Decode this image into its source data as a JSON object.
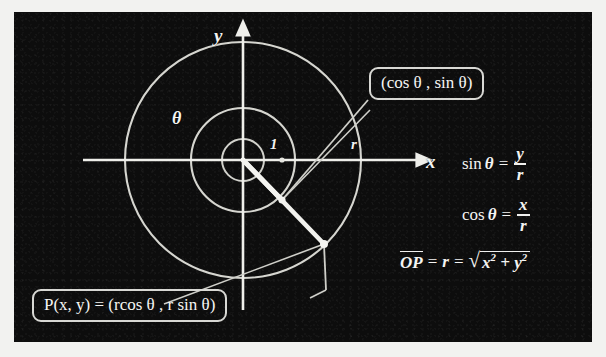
{
  "diagram": {
    "background_color": "#0d0d0d",
    "stroke_color": "#e8e8e4",
    "axes": {
      "x_label": "x",
      "y_label": "y",
      "origin_label": "O"
    },
    "angle_label": "θ",
    "tick_labels": {
      "unit": "1",
      "radius": "r"
    },
    "callouts": [
      {
        "name": "unit-circle-point",
        "text": "(cos θ , sin θ)"
      },
      {
        "name": "point-p",
        "text": "P(x, y) = (rcos θ , r sin θ)"
      }
    ],
    "equations": [
      {
        "name": "sine-definition",
        "function": "sin",
        "variable": "θ",
        "equals": "=",
        "numerator": "y",
        "denominator": "r"
      },
      {
        "name": "cosine-definition",
        "function": "cos",
        "variable": "θ",
        "equals": "=",
        "numerator": "x",
        "denominator": "r"
      }
    ],
    "radius_equation": {
      "name": "radius-magnitude",
      "segment": "OP",
      "equals_1": "=",
      "radius": "r",
      "equals_2": "=",
      "radicand_x": "x",
      "radicand_x_exp": "2",
      "plus": "+",
      "radicand_y": "y",
      "radicand_y_exp": "2"
    },
    "circles": [
      {
        "name": "outer-circle",
        "radius_px": 118
      },
      {
        "name": "unit-circle",
        "radius_px": 52
      },
      {
        "name": "inner-circle",
        "radius_px": 21
      }
    ],
    "points": [
      {
        "name": "unit-circle-point",
        "x_px": 268,
        "y_px": 188
      },
      {
        "name": "point-p",
        "x_px": 310,
        "y_px": 232
      }
    ]
  }
}
